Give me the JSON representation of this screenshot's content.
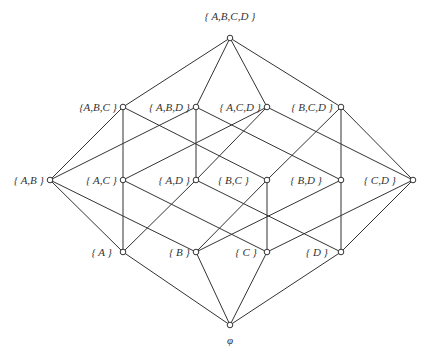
{
  "diagram": {
    "colors": {
      "line": "#333333",
      "node_fill": "#ffffff",
      "text": "#333333"
    },
    "nodes": [
      {
        "id": "ABCD",
        "label": "{ A,B,C,D }",
        "x": 230,
        "y": 38,
        "lx": 230,
        "ly": 20,
        "anchor": "middle"
      },
      {
        "id": "ABC",
        "label": "{A,B,C }",
        "x": 123,
        "y": 107,
        "lx": 117,
        "ly": 111,
        "anchor": "end"
      },
      {
        "id": "ABD",
        "label": "{ A,B,D }",
        "x": 196,
        "y": 107,
        "lx": 190,
        "ly": 111,
        "anchor": "end"
      },
      {
        "id": "ACD",
        "label": "{ A,C,D }",
        "x": 267,
        "y": 107,
        "lx": 261,
        "ly": 111,
        "anchor": "end"
      },
      {
        "id": "BCD",
        "label": "{ B,C,D }",
        "x": 341,
        "y": 107,
        "lx": 333,
        "ly": 111,
        "anchor": "end"
      },
      {
        "id": "AB",
        "label": "{ A,B }",
        "x": 50,
        "y": 180,
        "lx": 44,
        "ly": 184,
        "anchor": "end"
      },
      {
        "id": "AC",
        "label": "{ A,C }",
        "x": 123,
        "y": 180,
        "lx": 117,
        "ly": 184,
        "anchor": "end"
      },
      {
        "id": "AD",
        "label": "{ A,D }",
        "x": 196,
        "y": 180,
        "lx": 190,
        "ly": 184,
        "anchor": "end"
      },
      {
        "id": "BC",
        "label": "{ B,C }",
        "x": 267,
        "y": 180,
        "lx": 249,
        "ly": 184,
        "anchor": "end"
      },
      {
        "id": "BD",
        "label": "{ B,D }",
        "x": 341,
        "y": 180,
        "lx": 322,
        "ly": 184,
        "anchor": "end"
      },
      {
        "id": "CD",
        "label": "{ C,D }",
        "x": 413,
        "y": 180,
        "lx": 396,
        "ly": 184,
        "anchor": "end"
      },
      {
        "id": "A",
        "label": "{ A }",
        "x": 123,
        "y": 252,
        "lx": 112,
        "ly": 256,
        "anchor": "end"
      },
      {
        "id": "B",
        "label": "{ B }",
        "x": 196,
        "y": 252,
        "lx": 190,
        "ly": 256,
        "anchor": "end"
      },
      {
        "id": "C",
        "label": "{ C }",
        "x": 267,
        "y": 252,
        "lx": 257,
        "ly": 256,
        "anchor": "end"
      },
      {
        "id": "D",
        "label": "{ D }",
        "x": 341,
        "y": 252,
        "lx": 328,
        "ly": 256,
        "anchor": "end"
      },
      {
        "id": "E",
        "label": "φ",
        "x": 230,
        "y": 325,
        "lx": 230,
        "ly": 344,
        "anchor": "middle"
      }
    ],
    "edges": [
      [
        "ABCD",
        "ABC"
      ],
      [
        "ABCD",
        "ABD"
      ],
      [
        "ABCD",
        "ACD"
      ],
      [
        "ABCD",
        "BCD"
      ],
      [
        "ABC",
        "AB"
      ],
      [
        "ABC",
        "AC"
      ],
      [
        "ABC",
        "BC"
      ],
      [
        "ABD",
        "AB"
      ],
      [
        "ABD",
        "AD"
      ],
      [
        "ABD",
        "BD"
      ],
      [
        "ACD",
        "AC"
      ],
      [
        "ACD",
        "AD"
      ],
      [
        "ACD",
        "CD"
      ],
      [
        "BCD",
        "BC"
      ],
      [
        "BCD",
        "BD"
      ],
      [
        "BCD",
        "CD"
      ],
      [
        "AB",
        "A"
      ],
      [
        "AB",
        "B"
      ],
      [
        "AC",
        "A"
      ],
      [
        "AC",
        "C"
      ],
      [
        "AD",
        "A"
      ],
      [
        "AD",
        "D"
      ],
      [
        "BC",
        "B"
      ],
      [
        "BC",
        "C"
      ],
      [
        "BD",
        "B"
      ],
      [
        "BD",
        "D"
      ],
      [
        "CD",
        "C"
      ],
      [
        "CD",
        "D"
      ],
      [
        "A",
        "E"
      ],
      [
        "B",
        "E"
      ],
      [
        "C",
        "E"
      ],
      [
        "D",
        "E"
      ]
    ]
  }
}
